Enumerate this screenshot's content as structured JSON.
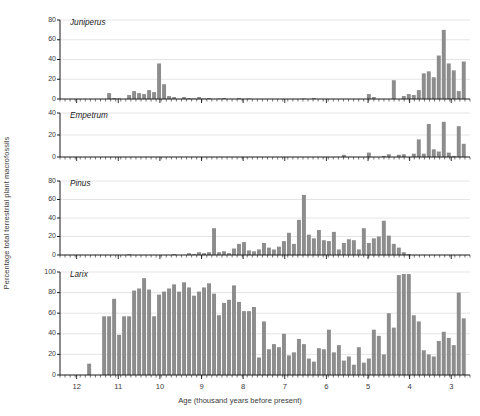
{
  "chart_data": {
    "type": "bar",
    "title": "",
    "xlabel": "Age (thousand years before present)",
    "ylabel": "Percentage total terrestrial plant macrofossils",
    "xlim": [
      12.4,
      2.55
    ],
    "x_reversed": true,
    "xticks": [
      12,
      11,
      10,
      9,
      8,
      7,
      6,
      5,
      4,
      3
    ],
    "grid": true,
    "legend": "none",
    "bar_color": "#8d8d8d",
    "axis_color": "#1a1a1a",
    "grid_color": "#c9c9c9",
    "panels": [
      {
        "name": "Juniperus",
        "ylim": [
          0,
          80
        ],
        "yticks": [
          0,
          20,
          40,
          60,
          80
        ],
        "x": [
          12.3,
          12.18,
          12.06,
          11.94,
          11.82,
          11.7,
          11.58,
          11.46,
          11.34,
          11.22,
          11.1,
          10.98,
          10.86,
          10.74,
          10.62,
          10.5,
          10.38,
          10.26,
          10.14,
          10.02,
          9.9,
          9.78,
          9.66,
          9.54,
          9.42,
          9.3,
          9.18,
          9.06,
          8.94,
          8.82,
          8.7,
          8.58,
          8.46,
          8.34,
          8.22,
          8.1,
          7.98,
          7.86,
          7.74,
          7.62,
          7.5,
          7.38,
          7.26,
          7.14,
          7.02,
          6.9,
          6.78,
          6.66,
          6.54,
          6.42,
          6.3,
          6.18,
          6.06,
          5.94,
          5.82,
          5.7,
          5.58,
          5.46,
          5.34,
          5.22,
          5.1,
          4.98,
          4.86,
          4.74,
          4.62,
          4.5,
          4.38,
          4.26,
          4.14,
          4.02,
          3.9,
          3.78,
          3.66,
          3.54,
          3.42,
          3.3,
          3.18,
          3.06,
          2.94,
          2.82,
          2.7
        ],
        "values": [
          0,
          0,
          0,
          0,
          0,
          0,
          0,
          0,
          0,
          6,
          1,
          0.5,
          0,
          4,
          8,
          6,
          5,
          9,
          7,
          36,
          15,
          3,
          2,
          0,
          2,
          1,
          0.5,
          2,
          0.5,
          1,
          0,
          0.5,
          1,
          0,
          0,
          1,
          0,
          0.5,
          0,
          0,
          0,
          0,
          0,
          0,
          0,
          0,
          0,
          0,
          0.5,
          0,
          1,
          0,
          0,
          0,
          0,
          0,
          0,
          0,
          0,
          0,
          0,
          5,
          2,
          0,
          0,
          0,
          19,
          0,
          3,
          5,
          4,
          9,
          26,
          28,
          22,
          44,
          70,
          36,
          29,
          8,
          38
        ]
      },
      {
        "name": "Empetrum",
        "ylim": [
          0,
          40
        ],
        "yticks": [
          0,
          20,
          40
        ],
        "x": [
          12.3,
          12.18,
          12.06,
          11.94,
          11.82,
          11.7,
          11.58,
          11.46,
          11.34,
          11.22,
          11.1,
          10.98,
          10.86,
          10.74,
          10.62,
          10.5,
          10.38,
          10.26,
          10.14,
          10.02,
          9.9,
          9.78,
          9.66,
          9.54,
          9.42,
          9.3,
          9.18,
          9.06,
          8.94,
          8.82,
          8.7,
          8.58,
          8.46,
          8.34,
          8.22,
          8.1,
          7.98,
          7.86,
          7.74,
          7.62,
          7.5,
          7.38,
          7.26,
          7.14,
          7.02,
          6.9,
          6.78,
          6.66,
          6.54,
          6.42,
          6.3,
          6.18,
          6.06,
          5.94,
          5.82,
          5.7,
          5.58,
          5.46,
          5.34,
          5.22,
          5.1,
          4.98,
          4.86,
          4.74,
          4.62,
          4.5,
          4.38,
          4.26,
          4.14,
          4.02,
          3.9,
          3.78,
          3.66,
          3.54,
          3.42,
          3.3,
          3.18,
          3.06,
          2.94,
          2.82,
          2.7
        ],
        "values": [
          0,
          0,
          0,
          0,
          0,
          0,
          0,
          0,
          0,
          0,
          0,
          0,
          0,
          0,
          0,
          0,
          0,
          0,
          0,
          0,
          0,
          0,
          0,
          0,
          0,
          0,
          0,
          0,
          0,
          0,
          0,
          0,
          0,
          0,
          0,
          0,
          0,
          0,
          0,
          0,
          0,
          0,
          0,
          0,
          0,
          0,
          0,
          0,
          0,
          0,
          0,
          0,
          0,
          0,
          0,
          0,
          2,
          0,
          0,
          0,
          0,
          4,
          0,
          0,
          1,
          2.5,
          0,
          2,
          2.5,
          0,
          3,
          16,
          3,
          30,
          7,
          5,
          32,
          4,
          1,
          28,
          12
        ]
      },
      {
        "name": "Pinus",
        "ylim": [
          0,
          80
        ],
        "yticks": [
          0,
          20,
          40,
          60,
          80
        ],
        "x": [
          12.3,
          12.18,
          12.06,
          11.94,
          11.82,
          11.7,
          11.58,
          11.46,
          11.34,
          11.22,
          11.1,
          10.98,
          10.86,
          10.74,
          10.62,
          10.5,
          10.38,
          10.26,
          10.14,
          10.02,
          9.9,
          9.78,
          9.66,
          9.54,
          9.42,
          9.3,
          9.18,
          9.06,
          8.94,
          8.82,
          8.7,
          8.58,
          8.46,
          8.34,
          8.22,
          8.1,
          7.98,
          7.86,
          7.74,
          7.62,
          7.5,
          7.38,
          7.26,
          7.14,
          7.02,
          6.9,
          6.78,
          6.66,
          6.54,
          6.42,
          6.3,
          6.18,
          6.06,
          5.94,
          5.82,
          5.7,
          5.58,
          5.46,
          5.34,
          5.22,
          5.1,
          4.98,
          4.86,
          4.74,
          4.62,
          4.5,
          4.38,
          4.26,
          4.14,
          4.02,
          3.9,
          3.78,
          3.66,
          3.54,
          3.42,
          3.3,
          3.18,
          3.06,
          2.94,
          2.82,
          2.7
        ],
        "values": [
          0,
          0,
          0,
          0,
          0,
          0,
          0,
          0,
          0,
          0,
          0,
          0,
          0,
          1,
          0,
          0,
          0,
          0,
          0,
          0,
          0,
          0,
          1,
          0,
          0,
          2,
          1,
          3,
          2,
          3,
          29,
          3,
          4,
          2,
          7,
          12,
          14,
          5,
          4,
          6,
          13,
          8,
          6,
          9,
          15,
          24,
          12,
          38,
          65,
          22,
          18,
          27,
          16,
          15,
          25,
          6,
          13,
          17,
          16,
          6,
          29,
          13,
          18,
          20,
          37,
          21,
          12,
          8,
          3,
          1,
          0,
          0,
          0,
          0,
          0,
          0,
          0,
          0,
          0,
          0,
          0
        ]
      },
      {
        "name": "Larix",
        "ylim": [
          0,
          100
        ],
        "yticks": [
          0,
          20,
          40,
          60,
          80,
          100
        ],
        "x": [
          12.3,
          12.18,
          12.06,
          11.94,
          11.82,
          11.7,
          11.58,
          11.46,
          11.34,
          11.22,
          11.1,
          10.98,
          10.86,
          10.74,
          10.62,
          10.5,
          10.38,
          10.26,
          10.14,
          10.02,
          9.9,
          9.78,
          9.66,
          9.54,
          9.42,
          9.3,
          9.18,
          9.06,
          8.94,
          8.82,
          8.7,
          8.58,
          8.46,
          8.34,
          8.22,
          8.1,
          7.98,
          7.86,
          7.74,
          7.62,
          7.5,
          7.38,
          7.26,
          7.14,
          7.02,
          6.9,
          6.78,
          6.66,
          6.54,
          6.42,
          6.3,
          6.18,
          6.06,
          5.94,
          5.82,
          5.7,
          5.58,
          5.46,
          5.34,
          5.22,
          5.1,
          4.98,
          4.86,
          4.74,
          4.62,
          4.5,
          4.38,
          4.26,
          4.14,
          4.02,
          3.9,
          3.78,
          3.66,
          3.54,
          3.42,
          3.3,
          3.18,
          3.06,
          2.94,
          2.82,
          2.7
        ],
        "values": [
          0,
          0,
          0,
          0,
          0,
          11,
          0,
          0,
          57,
          57,
          74,
          39,
          57,
          57,
          82,
          84,
          94,
          83,
          57,
          78,
          81,
          84,
          88,
          81,
          90,
          85,
          77,
          81,
          85,
          89,
          79,
          58,
          70,
          73,
          87,
          71,
          62,
          62,
          66,
          17,
          52,
          25,
          30,
          27,
          40,
          19,
          22,
          35,
          30,
          16,
          13,
          26,
          25,
          44,
          22,
          29,
          14,
          18,
          10,
          27,
          12,
          16,
          44,
          38,
          20,
          60,
          46,
          97,
          98,
          98,
          58,
          52,
          24,
          20,
          18,
          33,
          42,
          36,
          29,
          80,
          55
        ]
      }
    ]
  }
}
